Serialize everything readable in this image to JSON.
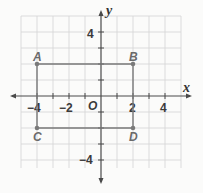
{
  "diagram": {
    "type": "coordinate-plane",
    "axes": {
      "x_label": "x",
      "y_label": "y",
      "origin_label": "O"
    },
    "x_ticks": [
      "−4",
      "−2",
      "2",
      "4"
    ],
    "y_ticks": [
      "4",
      "−4"
    ],
    "grid": {
      "xmin": -5,
      "xmax": 5,
      "ymin": -5,
      "ymax": 5,
      "step": 1
    },
    "points": [
      {
        "label": "A",
        "x": -4,
        "y": 2
      },
      {
        "label": "B",
        "x": 2,
        "y": 2
      },
      {
        "label": "C",
        "x": -4,
        "y": -2
      },
      {
        "label": "D",
        "x": 2,
        "y": -2
      }
    ],
    "shape": "rectangle ABDC",
    "colors": {
      "grid": "#d4d4d4",
      "axis": "#4a4a4a",
      "rectangle": "#7a7a7a"
    }
  }
}
